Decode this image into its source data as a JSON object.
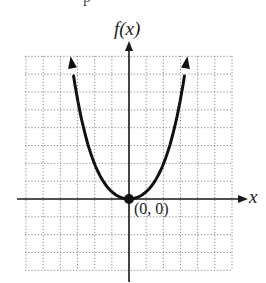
{
  "chart_data": {
    "type": "line",
    "title": "",
    "xlabel": "x",
    "ylabel": "f(x)",
    "xlim": [
      -6,
      6
    ],
    "ylim": [
      -4,
      8
    ],
    "grid": true,
    "grid_style": "dotted",
    "series": [
      {
        "name": "f(x)",
        "description": "Upward-opening curve with vertex at origin, arrows on both ends",
        "x": [
          -3.4,
          -3,
          -2.5,
          -2,
          -1.5,
          -1,
          -0.5,
          0,
          0.5,
          1,
          1.5,
          2,
          2.5,
          3,
          3.4
        ],
        "y": [
          8,
          6.2,
          4.3,
          2.75,
          1.55,
          0.69,
          0.17,
          0,
          0.17,
          0.69,
          1.55,
          2.75,
          4.3,
          6.2,
          8
        ]
      }
    ],
    "annotations": [
      {
        "text": "(0, 0)",
        "x": 0,
        "y": 0,
        "marker": "filled-dot"
      }
    ]
  },
  "labels": {
    "y_axis": "f(x)",
    "x_axis": "x",
    "origin": "(0, 0)",
    "top_fragment": "p"
  },
  "colors": {
    "curve": "#111111",
    "axes": "#1a1a1a",
    "grid": "#8a8a8a",
    "background": "#ffffff"
  }
}
